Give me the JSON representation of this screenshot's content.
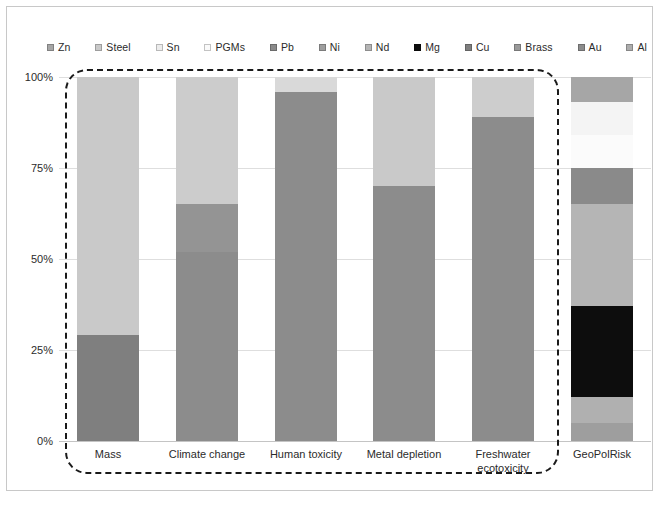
{
  "chart_data": {
    "type": "bar",
    "stacked": true,
    "normalized": true,
    "title": "",
    "xlabel": "",
    "ylabel": "",
    "ylim": [
      0,
      100
    ],
    "ytick_labels": [
      "100%",
      "75%",
      "50%",
      "25%",
      "0%"
    ],
    "ytick_values": [
      100,
      75,
      50,
      25,
      0
    ],
    "grid": true,
    "legend_position": "top",
    "categories": [
      "Mass",
      "Climate change",
      "Human toxicity",
      "Metal depletion",
      "Freshwater ecotoxicity",
      "GeoPolRisk"
    ],
    "series": [
      {
        "name": "Zn",
        "color": "#a6a6a6",
        "values": [
          0.0,
          0.0,
          0.0,
          0.0,
          0.0,
          6.0
        ]
      },
      {
        "name": "Steel",
        "color": "#c9c9c9",
        "values": [
          71.0,
          0.0,
          0.0,
          0.0,
          0.0,
          0.0
        ]
      },
      {
        "name": "Sn",
        "color": "#f2f2f2",
        "values": [
          0.0,
          0.0,
          0.0,
          0.0,
          0.0,
          9.0
        ]
      },
      {
        "name": "PGMs",
        "color": "#fbfbfb",
        "values": [
          0.0,
          0.0,
          4.0,
          30.0,
          11.0,
          9.0
        ]
      },
      {
        "name": "Pb",
        "color": "#8a8a8a",
        "values": [
          0.0,
          0.0,
          0.0,
          0.0,
          0.0,
          10.0
        ]
      },
      {
        "name": "Ni",
        "color": "#9e9e9e",
        "values": [
          0.0,
          0.0,
          0.0,
          0.0,
          0.0,
          0.0
        ]
      },
      {
        "name": "Nd",
        "color": "#b5b5b5",
        "values": [
          0.0,
          0.0,
          0.0,
          0.0,
          0.0,
          28.0
        ]
      },
      {
        "name": "Mg",
        "color": "#0d0d0d",
        "values": [
          0.0,
          0.0,
          0.0,
          0.0,
          0.0,
          25.0
        ]
      },
      {
        "name": "Cu",
        "color": "#7f7f7f",
        "values": [
          29.0,
          0.0,
          0.0,
          0.0,
          0.0,
          0.0
        ]
      },
      {
        "name": "Brass",
        "color": "#9a9a9a",
        "values": [
          0.0,
          0.0,
          0.0,
          0.0,
          0.0,
          7.0
        ]
      },
      {
        "name": "Au",
        "color": "#8c8c8c",
        "values": [
          0.0,
          35.0,
          96.0,
          70.0,
          89.0,
          6.0
        ]
      },
      {
        "name": "Al",
        "color": "#adadad",
        "values": [
          0.0,
          65.0,
          0.0,
          0.0,
          0.0,
          0.0
        ]
      }
    ],
    "stack_order_bottom_to_top": [
      "Zn",
      "Steel",
      "Sn",
      "PGMs",
      "Pb",
      "Ni",
      "Nd",
      "Mg",
      "Cu",
      "Brass",
      "Au",
      "Al"
    ],
    "bars": [
      {
        "category": "Mass",
        "segments": [
          {
            "name": "Cu",
            "value": 29.0,
            "color": "#7f7f7f"
          },
          {
            "name": "Steel",
            "value": 71.0,
            "color": "#c9c9c9"
          }
        ]
      },
      {
        "category": "Climate change",
        "segments": [
          {
            "name": "Au",
            "value": 52.0,
            "color": "#8c8c8c"
          },
          {
            "name": "Al",
            "value": 13.0,
            "color": "#949494"
          },
          {
            "name": "PGMs",
            "value": 35.0,
            "color": "#cccccc"
          }
        ]
      },
      {
        "category": "Human toxicity",
        "segments": [
          {
            "name": "Au",
            "value": 96.0,
            "color": "#8c8c8c"
          },
          {
            "name": "PGMs",
            "value": 4.0,
            "color": "#d9d9d9"
          }
        ]
      },
      {
        "category": "Metal depletion",
        "segments": [
          {
            "name": "Au",
            "value": 70.0,
            "color": "#8c8c8c"
          },
          {
            "name": "PGMs",
            "value": 30.0,
            "color": "#c9c9c9"
          }
        ]
      },
      {
        "category": "Freshwater ecotoxicity",
        "segments": [
          {
            "name": "Au",
            "value": 89.0,
            "color": "#8c8c8c"
          },
          {
            "name": "PGMs",
            "value": 11.0,
            "color": "#cdcdcd"
          }
        ]
      },
      {
        "category": "GeoPolRisk",
        "segments": [
          {
            "name": "Brass",
            "value": 5.0,
            "color": "#9e9e9e"
          },
          {
            "name": "Al",
            "value": 7.0,
            "color": "#b0b0b0"
          },
          {
            "name": "Mg",
            "value": 25.0,
            "color": "#0d0d0d"
          },
          {
            "name": "Nd",
            "value": 28.0,
            "color": "#b5b5b5"
          },
          {
            "name": "Pb",
            "value": 10.0,
            "color": "#8a8a8a"
          },
          {
            "name": "PGMs",
            "value": 9.0,
            "color": "#fbfbfb"
          },
          {
            "name": "Sn",
            "value": 9.0,
            "color": "#f4f4f4"
          },
          {
            "name": "Zn",
            "value": 7.0,
            "color": "#a6a6a6"
          }
        ]
      }
    ]
  },
  "legend": {
    "items": [
      {
        "label": "Zn",
        "color": "#a6a6a6"
      },
      {
        "label": "Steel",
        "color": "#c9c9c9"
      },
      {
        "label": "Sn",
        "color": "#ececec"
      },
      {
        "label": "PGMs",
        "color": "#fafafa"
      },
      {
        "label": "Pb",
        "color": "#8a8a8a"
      },
      {
        "label": "Ni",
        "color": "#9e9e9e"
      },
      {
        "label": "Nd",
        "color": "#b5b5b5"
      },
      {
        "label": "Mg",
        "color": "#0d0d0d"
      },
      {
        "label": "Cu",
        "color": "#7f7f7f"
      },
      {
        "label": "Brass",
        "color": "#9a9a9a"
      },
      {
        "label": "Au",
        "color": "#8c8c8c"
      },
      {
        "label": "Al",
        "color": "#adadad"
      }
    ]
  },
  "axes": {
    "y_ticks": [
      {
        "label": "100%",
        "value": 100
      },
      {
        "label": "75%",
        "value": 75
      },
      {
        "label": "50%",
        "value": 50
      },
      {
        "label": "25%",
        "value": 25
      },
      {
        "label": "0%",
        "value": 0
      }
    ],
    "x_labels": [
      "Mass",
      "Climate change",
      "Human toxicity",
      "Metal depletion",
      "Freshwater ecotoxicity",
      "GeoPolRisk"
    ]
  },
  "annotations": {
    "highlight_box_label": "lca-indicators-group"
  }
}
